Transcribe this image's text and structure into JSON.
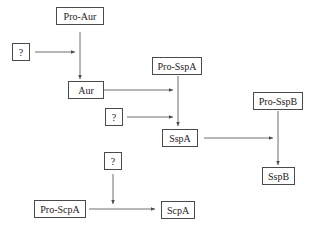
{
  "nodes": {
    "pro_aur": "Pro-Aur",
    "q1": "?",
    "aur": "Aur",
    "pro_sspa": "Pro-SspA",
    "q2": "?",
    "sspa": "SspA",
    "pro_sspb": "Pro-SspB",
    "sspb": "SspB",
    "q3": "?",
    "pro_scpa": "Pro-ScpA",
    "scpa": "ScpA"
  },
  "edges": [
    {
      "from": "pro_aur",
      "to": "aur"
    },
    {
      "from": "q1",
      "to": "pro_aur-aur edge"
    },
    {
      "from": "pro_sspa",
      "to": "sspa"
    },
    {
      "from": "aur",
      "to": "pro_sspa-sspa edge"
    },
    {
      "from": "q2",
      "to": "pro_sspa-sspa edge"
    },
    {
      "from": "pro_sspb",
      "to": "sspb"
    },
    {
      "from": "sspa",
      "to": "pro_sspb-sspb edge"
    },
    {
      "from": "pro_scpa",
      "to": "scpa"
    },
    {
      "from": "q3",
      "to": "pro_scpa-scpa edge"
    }
  ],
  "colors": {
    "line": "#4a4a4a",
    "background": "#ffffff"
  }
}
